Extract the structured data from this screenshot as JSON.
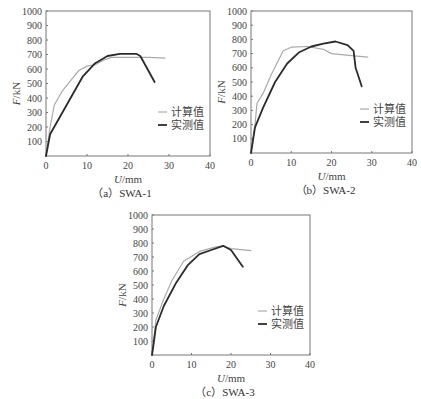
{
  "figure": {
    "legend": {
      "calc": "计算值",
      "meas": "实测值"
    },
    "colors": {
      "calc": "#aaaaaa",
      "meas": "#2b2b2b",
      "axis": "#777777"
    }
  },
  "chart_data": [
    {
      "type": "line",
      "title": "（a）SWA-1",
      "xlabel": "U/mm",
      "ylabel": "F/kN",
      "xlim": [
        0,
        40
      ],
      "ylim": [
        0,
        1000
      ],
      "xticks": [
        0,
        10,
        20,
        30,
        40
      ],
      "yticks": [
        100,
        200,
        300,
        400,
        500,
        600,
        700,
        800,
        900,
        1000
      ],
      "grid": false,
      "legend_position": "lower right",
      "series": [
        {
          "name": "计算值",
          "x": [
            0,
            1,
            2,
            4,
            6,
            8,
            10,
            12,
            14,
            16,
            20,
            25,
            29
          ],
          "y": [
            0,
            200,
            350,
            450,
            520,
            590,
            620,
            630,
            660,
            680,
            680,
            680,
            675
          ]
        },
        {
          "name": "实测值",
          "x": [
            0,
            1,
            3,
            6,
            9,
            12,
            15,
            18,
            22,
            23,
            26.5
          ],
          "y": [
            0,
            150,
            250,
            400,
            550,
            640,
            690,
            705,
            705,
            690,
            510
          ]
        }
      ]
    },
    {
      "type": "line",
      "title": "（b）SWA-2",
      "xlabel": "U/mm",
      "ylabel": "F/kN",
      "xlim": [
        0,
        40
      ],
      "ylim": [
        0,
        1000
      ],
      "xticks": [
        0,
        10,
        20,
        30,
        40
      ],
      "yticks": [
        100,
        200,
        300,
        400,
        500,
        600,
        700,
        800,
        900,
        1000
      ],
      "grid": false,
      "legend_position": "lower right",
      "series": [
        {
          "name": "计算值",
          "x": [
            0,
            1,
            1.5,
            3,
            5,
            8,
            10,
            14,
            18,
            20,
            25,
            29
          ],
          "y": [
            0,
            200,
            350,
            420,
            550,
            720,
            745,
            750,
            730,
            700,
            685,
            675
          ]
        },
        {
          "name": "实测值",
          "x": [
            0,
            1,
            3,
            6,
            9,
            12,
            15,
            18,
            21,
            24,
            25.5,
            26,
            27.5
          ],
          "y": [
            0,
            180,
            320,
            500,
            630,
            710,
            750,
            770,
            785,
            760,
            720,
            600,
            470
          ]
        }
      ]
    },
    {
      "type": "line",
      "title": "（c）SWA-3",
      "xlabel": "U/mm",
      "ylabel": "F/kN",
      "xlim": [
        0,
        40
      ],
      "ylim": [
        0,
        1000
      ],
      "xticks": [
        0,
        10,
        20,
        30,
        40
      ],
      "yticks": [
        100,
        200,
        300,
        400,
        500,
        600,
        700,
        800,
        900,
        1000
      ],
      "grid": false,
      "legend_position": "lower right",
      "series": [
        {
          "name": "计算值",
          "x": [
            0,
            1,
            3,
            5,
            8,
            12,
            16,
            18,
            20,
            25
          ],
          "y": [
            0,
            250,
            400,
            530,
            670,
            740,
            770,
            780,
            760,
            745
          ]
        },
        {
          "name": "实测值",
          "x": [
            0,
            0.5,
            1,
            3,
            6,
            9,
            12,
            15,
            18,
            20,
            23
          ],
          "y": [
            0,
            100,
            200,
            350,
            510,
            640,
            720,
            750,
            780,
            750,
            630
          ]
        }
      ]
    }
  ]
}
